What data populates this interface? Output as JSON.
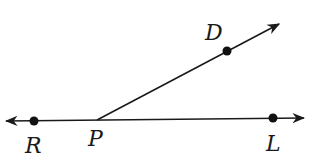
{
  "diagram": {
    "type": "geometry-angle",
    "points": [
      {
        "id": "R",
        "label": "R",
        "x": 34,
        "y": 121
      },
      {
        "id": "P",
        "label": "P",
        "x": 97,
        "y": 120
      },
      {
        "id": "L",
        "label": "L",
        "x": 273,
        "y": 118
      },
      {
        "id": "D",
        "label": "D",
        "x": 227,
        "y": 51
      }
    ],
    "elements": [
      {
        "type": "line",
        "through": [
          "R",
          "L"
        ],
        "arrows": "both"
      },
      {
        "type": "ray",
        "from": "P",
        "through": "D",
        "arrows": "end"
      }
    ],
    "labels": {
      "R": "R",
      "P": "P",
      "L": "L",
      "D": "D"
    },
    "colors": {
      "stroke": "#1a1a1a",
      "background": "#ffffff"
    }
  }
}
